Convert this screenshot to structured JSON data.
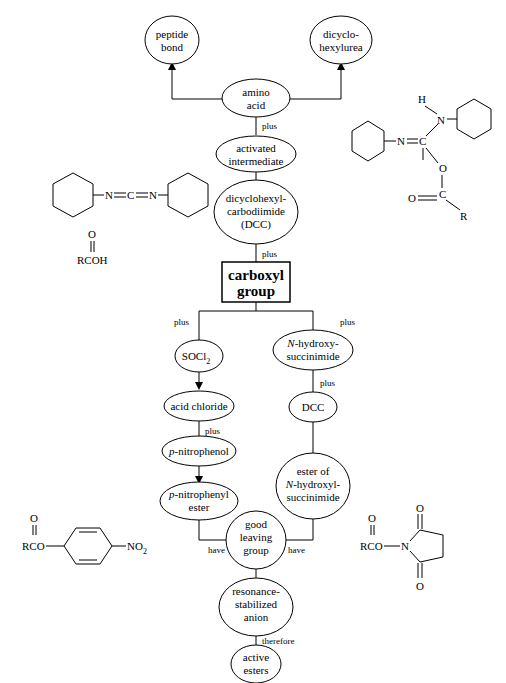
{
  "diagram": {
    "central_node": "carboxyl group",
    "nodes": {
      "peptide_bond": [
        "peptide",
        "bond"
      ],
      "dicyclohexylurea": [
        "dicyclo-",
        "hexylurea"
      ],
      "amino_acid": [
        "amino",
        "acid"
      ],
      "activated_intermediate": [
        "activated",
        "intermediate"
      ],
      "dcc": [
        "dicyclohexyl-",
        "carbodiimide",
        "(DCC)"
      ],
      "carboxyl_group": [
        "carboxyl",
        "group"
      ],
      "socl2": "SOCl",
      "socl2_sub": "2",
      "acid_chloride": "acid chloride",
      "p_nitrophenol": "-nitrophenol",
      "p_nitrophenol_prefix": "p",
      "p_nitrophenyl_ester": [
        "-nitrophenyl",
        "ester"
      ],
      "p_nitrophenyl_ester_prefix": "p",
      "n_hydroxysuccinimide": [
        "-hydroxy-",
        "succinimide"
      ],
      "n_hydroxysuccinimide_prefix": "N",
      "dcc2": "DCC",
      "ester_nhs": [
        "ester of",
        "-hydroxyl-",
        "succinimide"
      ],
      "ester_nhs_prefix": "N",
      "good_leaving_group": [
        "good",
        "leaving",
        "group"
      ],
      "resonance_anion": [
        "resonance-",
        "stabilized",
        "anion"
      ],
      "active_esters": [
        "active",
        "esters"
      ]
    },
    "edge_labels": {
      "amino_to_activated": "plus",
      "dcc_to_carboxyl": "plus",
      "carboxyl_left": "plus",
      "carboxyl_right": "plus",
      "acid_chloride_to_pnp": "plus",
      "nhs_to_dcc": "plus",
      "pnp_ester_have": "have",
      "nhs_ester_have": "have",
      "resonance_therefore": "therefore"
    },
    "structures": {
      "dcc_formula": [
        "N",
        "C",
        "N"
      ],
      "carboxylic_acid": {
        "o": "O",
        "formula": "RCOH"
      },
      "intermediate": {
        "h": "H",
        "n1": "N",
        "n2": "N",
        "c": "C",
        "o": "O",
        "o2": "O",
        "c2": "C",
        "r": "R"
      },
      "pnp_ester": {
        "o": "O",
        "rco": "RCO",
        "no2": "NO",
        "no2_sub": "2"
      },
      "nhs_ester": {
        "o": "O",
        "rco": "RCO",
        "n": "N",
        "o_top": "O",
        "o_bottom": "O"
      }
    }
  }
}
